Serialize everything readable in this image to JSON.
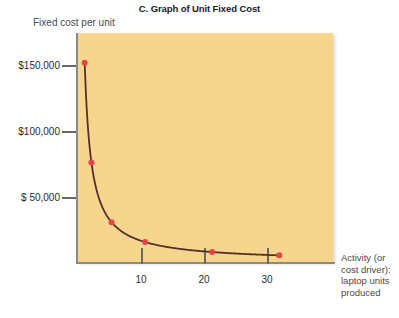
{
  "chart_data": {
    "type": "line",
    "title": "C. Graph of Unit Fixed Cost",
    "ylabel": "Fixed cost per unit",
    "xlabel": "Activity (or cost driver): laptop units produced",
    "x": [
      1,
      2,
      5,
      10,
      20,
      30
    ],
    "values": [
      150000,
      75000,
      30000,
      15000,
      7500,
      5000
    ],
    "series": [
      {
        "name": "Unit fixed cost",
        "values": [
          150000,
          75000,
          30000,
          15000,
          7500,
          5000
        ]
      }
    ],
    "ytick_labels": [
      "$150,000",
      "$100,000",
      "$ 50,000"
    ],
    "ytick_values": [
      150000,
      100000,
      50000
    ],
    "xtick_labels": [
      "10",
      "20",
      "30"
    ],
    "xtick_values": [
      10,
      20,
      30
    ],
    "xlim": [
      0,
      38
    ],
    "ylim": [
      0,
      172500
    ],
    "grid": false,
    "legend": "none",
    "markers": true,
    "marker_color": "#e8434a",
    "line_color": "#5a2d2d",
    "plot_background": "#f5d68c",
    "axis_color": "#8d8a84"
  },
  "title": {
    "text": "C. Graph of Unit Fixed Cost"
  },
  "axes": {
    "y_caption": "Fixed cost per unit",
    "x_caption_lines": [
      "Activity (or",
      "cost driver):",
      "laptop units",
      "produced"
    ],
    "y_ticks": [
      {
        "label": "$150,000",
        "value": 150000
      },
      {
        "label": "$100,000",
        "value": 100000
      },
      {
        "label": "$ 50,000",
        "value": 50000
      }
    ],
    "x_ticks": [
      {
        "label": "10",
        "value": 10
      },
      {
        "label": "20",
        "value": 20
      },
      {
        "label": "30",
        "value": 30
      }
    ]
  }
}
